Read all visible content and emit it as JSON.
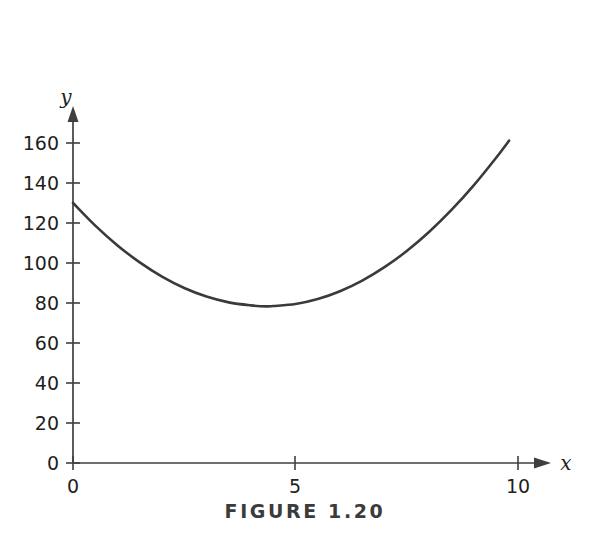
{
  "caption": "FIGURE 1.20",
  "axes": {
    "x_name": "x",
    "y_name": "y",
    "x_ticks": [
      "0",
      "5",
      "10"
    ],
    "y_ticks": [
      "0",
      "20",
      "40",
      "60",
      "80",
      "100",
      "120",
      "140",
      "160"
    ]
  },
  "colors": {
    "curve": "#3a3a3a",
    "axis": "#3f3f3f",
    "text": "#231f20",
    "caption": "#3b3b3b",
    "background": "#ffffff"
  },
  "chart_data": {
    "type": "line",
    "title": "FIGURE 1.20",
    "xlabel": "x",
    "ylabel": "y",
    "xlim": [
      0,
      10
    ],
    "ylim": [
      0,
      160
    ],
    "xticks": [
      0,
      5,
      10
    ],
    "yticks": [
      0,
      20,
      40,
      60,
      80,
      100,
      120,
      140,
      160
    ],
    "grid": false,
    "legend": "none",
    "series": [
      {
        "name": "curve",
        "x": [
          0,
          0.5,
          1,
          1.5,
          2,
          2.5,
          3,
          3.5,
          4,
          4.35,
          4.5,
          5,
          5.5,
          6,
          6.5,
          7,
          7.5,
          8,
          8.5,
          9,
          9.5,
          9.8
        ],
        "y": [
          130,
          118.7,
          108.8,
          100.3,
          93.2,
          87.5,
          83.2,
          80.3,
          78.8,
          78.3,
          78.5,
          79.5,
          82.0,
          85.9,
          91.2,
          97.9,
          106.0,
          115.5,
          126.4,
          138.7,
          152.4,
          161.2
        ]
      }
    ],
    "annotations": {
      "minimum": {
        "x": 4.35,
        "y": 78.3
      },
      "y_intercept": {
        "x": 0,
        "y": 130
      },
      "right_endpoint": {
        "x": 9.8,
        "y": 161
      }
    }
  }
}
